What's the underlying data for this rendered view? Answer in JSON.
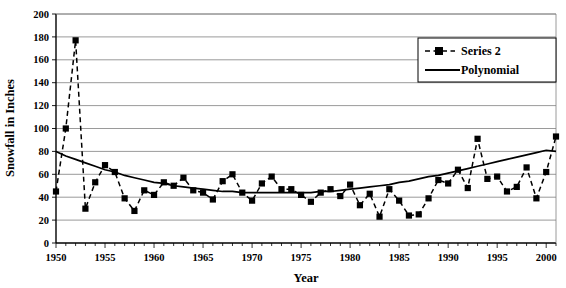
{
  "chart_data": {
    "type": "line",
    "title": "",
    "xlabel": "Year",
    "ylabel": "Snowfall in Inches",
    "xlim": [
      1950,
      2001
    ],
    "ylim": [
      0,
      200
    ],
    "ytick_step": 20,
    "xtick_step": 5,
    "minor_xtick_step": 1,
    "grid": "horizontal",
    "legend_position": "top-right",
    "legend": [
      {
        "name": "Series 2",
        "style": "dashed-line-with-square-markers",
        "color": "#000000"
      },
      {
        "name": "Polynomial",
        "style": "solid-line",
        "color": "#000000"
      }
    ],
    "ytick_labels": [
      "0",
      "20",
      "40",
      "60",
      "80",
      "100",
      "120",
      "140",
      "160",
      "180",
      "200"
    ],
    "xtick_labels": [
      "1950",
      "1955",
      "1960",
      "1965",
      "1970",
      "1975",
      "1980",
      "1985",
      "1990",
      "1995",
      "2000"
    ],
    "x": [
      1950,
      1951,
      1952,
      1953,
      1954,
      1955,
      1956,
      1957,
      1958,
      1959,
      1960,
      1961,
      1962,
      1963,
      1964,
      1965,
      1966,
      1967,
      1968,
      1969,
      1970,
      1971,
      1972,
      1973,
      1974,
      1975,
      1976,
      1977,
      1978,
      1979,
      1980,
      1981,
      1982,
      1983,
      1984,
      1985,
      1986,
      1987,
      1988,
      1989,
      1990,
      1991,
      1992,
      1993,
      1994,
      1995,
      1996,
      1997,
      1998,
      1999,
      2000,
      2001
    ],
    "series": [
      {
        "name": "Series 2",
        "values": [
          45,
          100,
          177,
          30,
          53,
          68,
          62,
          39,
          28,
          46,
          42,
          53,
          50,
          57,
          46,
          44,
          38,
          54,
          60,
          44,
          37,
          52,
          58,
          47,
          47,
          42,
          36,
          44,
          47,
          41,
          51,
          33,
          43,
          23,
          47,
          37,
          24,
          25,
          39,
          55,
          52,
          64,
          48,
          91,
          56,
          58,
          45,
          49,
          66,
          39,
          62,
          93
        ]
      },
      {
        "name": "Polynomial",
        "description": "quadratic trend fit",
        "values": [
          80,
          76,
          73,
          70,
          67,
          64,
          62,
          59,
          57,
          55,
          53,
          52,
          50,
          49,
          48,
          47,
          46,
          45,
          45,
          44,
          44,
          44,
          44,
          44,
          44,
          44,
          44,
          45,
          45,
          46,
          47,
          48,
          49,
          50,
          51,
          53,
          54,
          56,
          58,
          59,
          61,
          63,
          65,
          67,
          69,
          71,
          73,
          75,
          77,
          79,
          81,
          80
        ]
      }
    ]
  }
}
